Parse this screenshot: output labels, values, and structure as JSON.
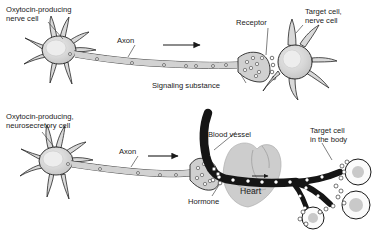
{
  "figure": {
    "background_color": "#ffffff",
    "ink_color": "#1a1a1a",
    "cell_fill": "#d4d4d4",
    "nucleus_fill": "#ececec",
    "vessel_fill": "#151515",
    "heart_fill": "#c9c9c9"
  },
  "panel_top": {
    "name": "synaptic-signaling",
    "labels": {
      "source_cell": "Oxytocin-producing\nnerve cell",
      "source_cell_line1": "Oxytocin-producing",
      "source_cell_line2": "nerve cell",
      "axon": "Axon",
      "receptor": "Receptor",
      "target_cell_line1": "Target cell,",
      "target_cell_line2": "nerve cell",
      "signaling_substance": "Signaling substance"
    }
  },
  "panel_bottom": {
    "name": "hormonal-signaling",
    "labels": {
      "source_cell_line1": "Oxytocin-producing,",
      "source_cell_line2": "neurosecretory cell",
      "axon": "Axon",
      "blood_vessel": "Blood vessel",
      "hormone": "Hormone",
      "heart": "Heart",
      "target_cell_line1": "Target cell",
      "target_cell_line2": "in the body"
    }
  }
}
